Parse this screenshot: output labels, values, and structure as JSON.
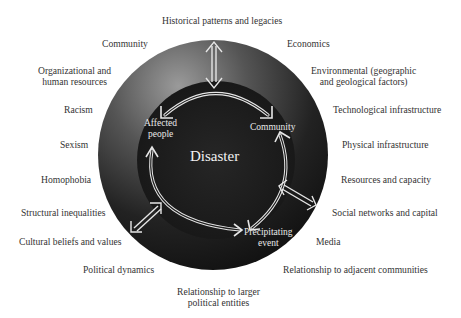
{
  "diagram": {
    "center_title": "Disaster",
    "inner_cycle": {
      "nodes": [
        {
          "label_line1": "Affected",
          "label_line2": "people"
        },
        {
          "label_line1": "Community",
          "label_line2": ""
        },
        {
          "label_line1": "Precipitating",
          "label_line2": "event"
        }
      ]
    },
    "outer_factors": [
      {
        "label": "Historical patterns and legacies"
      },
      {
        "label": "Community"
      },
      {
        "label": "Economics"
      },
      {
        "label_line1": "Organizational and",
        "label_line2": "human resources"
      },
      {
        "label_line1": "Environmental (geographic",
        "label_line2": "and geological factors)"
      },
      {
        "label": "Racism"
      },
      {
        "label": "Technological infrastructure"
      },
      {
        "label": "Sexism"
      },
      {
        "label": "Physical infrastructure"
      },
      {
        "label": "Homophobia"
      },
      {
        "label": "Resources and capacity"
      },
      {
        "label": "Structural inequalities"
      },
      {
        "label": "Social networks and capital"
      },
      {
        "label": "Cultural beliefs and values"
      },
      {
        "label": "Media"
      },
      {
        "label": "Political dynamics"
      },
      {
        "label": "Relationship to adjacent communities"
      },
      {
        "label_line1": "Relationship to larger",
        "label_line2": "political entities"
      }
    ],
    "colors": {
      "outer_ring_light": "#8a8a8a",
      "outer_ring_dark": "#1c1c1c",
      "inner_circle": "#1e1e1e",
      "arrow": "#e0e0e0",
      "text": "#333333"
    }
  }
}
